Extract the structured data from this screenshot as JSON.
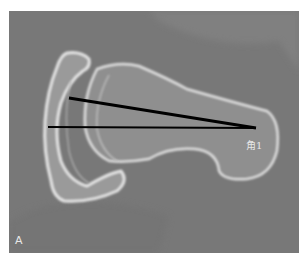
{
  "figure": {
    "panel_label": "A",
    "angle_label": "角1",
    "colors": {
      "background": "#7a7a7a",
      "bone": "#d8d8d8",
      "line": "#000000"
    }
  }
}
